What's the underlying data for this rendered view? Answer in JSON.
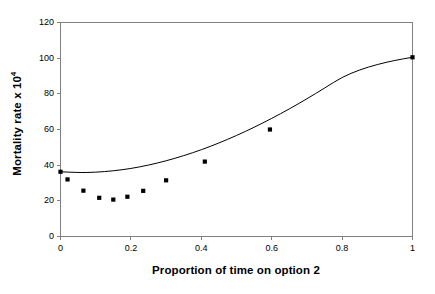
{
  "chart_data": {
    "type": "scatter",
    "title": "",
    "xlabel": "Proportion of time on option 2",
    "ylabel": "Mortality rate x 10",
    "ylabel_exponent": "4",
    "xlim": [
      0,
      1
    ],
    "ylim": [
      0,
      120
    ],
    "xticks": [
      0,
      0.2,
      0.4,
      0.6,
      0.8,
      1
    ],
    "xtick_labels": [
      "0",
      "0.2",
      "0.4",
      "0.6",
      "0.8",
      "1"
    ],
    "yticks": [
      0,
      20,
      40,
      60,
      80,
      100,
      120
    ],
    "ytick_labels": [
      "0",
      "20",
      "40",
      "60",
      "80",
      "100",
      "120"
    ],
    "grid": false,
    "legend": false,
    "legend_position": "none",
    "marker": "square",
    "marker_color": "#000000",
    "line_color": "#000000",
    "axis_color": "#808080",
    "frame": true,
    "series": [
      {
        "name": "observed",
        "type": "scatter",
        "x": [
          0.0,
          0.02,
          0.065,
          0.11,
          0.15,
          0.19,
          0.235,
          0.3,
          0.41,
          0.595,
          1.0
        ],
        "y": [
          36.3,
          32.0,
          25.7,
          21.7,
          20.7,
          22.3,
          25.6,
          31.5,
          42.0,
          60.0,
          100.5
        ]
      },
      {
        "name": "fitted curve",
        "type": "line",
        "x": [
          0.0,
          0.05,
          0.1,
          0.15,
          0.2,
          0.25,
          0.3,
          0.35,
          0.4,
          0.45,
          0.5,
          0.55,
          0.6,
          0.65,
          0.7,
          0.75,
          0.8,
          0.85,
          0.9,
          0.95,
          1.0
        ],
        "y": [
          36.3,
          35.8,
          36.0,
          36.8,
          38.1,
          40.0,
          42.4,
          45.3,
          48.6,
          52.4,
          56.6,
          61.2,
          66.2,
          71.5,
          77.2,
          83.2,
          89.4,
          93.5,
          96.5,
          98.8,
          100.5
        ]
      }
    ]
  },
  "figure": {
    "width": 435,
    "height": 294,
    "background": "#ffffff"
  }
}
